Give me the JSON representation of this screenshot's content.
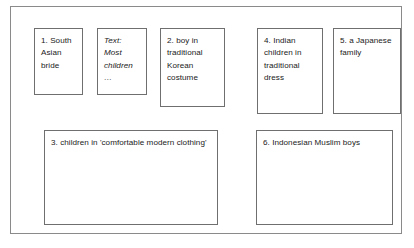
{
  "diagram": {
    "frame": {
      "name": "outer-frame",
      "border_color": "#8a8a8a",
      "background": "#ffffff"
    },
    "nodes": [
      {
        "id": "node-1",
        "text": "1. South Asian bride",
        "style": "normal"
      },
      {
        "id": "node-text-box",
        "text": "Text: Most children\n…",
        "style": "italic"
      },
      {
        "id": "node-2",
        "text": "2. boy in traditional Korean costume",
        "style": "normal"
      },
      {
        "id": "node-4",
        "text": "4. Indian children in traditional dress",
        "style": "normal"
      },
      {
        "id": "node-5",
        "text": "5. a Japanese family",
        "style": "normal"
      },
      {
        "id": "node-3",
        "text": "3. children in 'comfortable modern clothing'",
        "style": "normal"
      },
      {
        "id": "node-6",
        "text": "6. Indonesian Muslim boys",
        "style": "normal"
      }
    ]
  }
}
